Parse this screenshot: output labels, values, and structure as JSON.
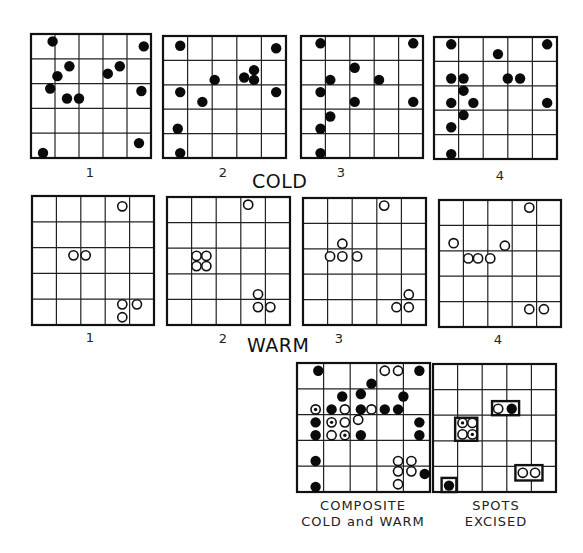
{
  "title_cold": "COLD",
  "title_warm": "WARM",
  "grid_cells": 5,
  "cold": [
    {
      "label": "1",
      "spots": [
        [
          0.9,
          0.3
        ],
        [
          4.7,
          0.5
        ],
        [
          1.6,
          1.3
        ],
        [
          1.1,
          1.7
        ],
        [
          3.2,
          1.6
        ],
        [
          3.7,
          1.3
        ],
        [
          0.8,
          2.2
        ],
        [
          1.5,
          2.6
        ],
        [
          2.0,
          2.6
        ],
        [
          4.6,
          2.3
        ],
        [
          0.5,
          4.8
        ],
        [
          4.5,
          4.4
        ]
      ]
    },
    {
      "label": "2",
      "spots": [
        [
          0.7,
          0.4
        ],
        [
          4.6,
          0.5
        ],
        [
          2.1,
          1.8
        ],
        [
          3.3,
          1.7
        ],
        [
          3.7,
          1.4
        ],
        [
          3.7,
          1.8
        ],
        [
          0.7,
          2.3
        ],
        [
          4.6,
          2.3
        ],
        [
          1.6,
          2.7
        ],
        [
          0.6,
          3.8
        ],
        [
          0.7,
          4.8
        ]
      ]
    },
    {
      "label": "3",
      "spots": [
        [
          0.8,
          0.3
        ],
        [
          4.6,
          0.3
        ],
        [
          2.2,
          1.3
        ],
        [
          1.2,
          1.8
        ],
        [
          3.2,
          1.8
        ],
        [
          0.8,
          2.3
        ],
        [
          2.2,
          2.7
        ],
        [
          4.6,
          2.7
        ],
        [
          1.2,
          3.3
        ],
        [
          0.8,
          3.8
        ],
        [
          0.8,
          4.8
        ]
      ]
    },
    {
      "label": "4",
      "spots": [
        [
          0.7,
          0.3
        ],
        [
          4.6,
          0.3
        ],
        [
          2.6,
          0.7
        ],
        [
          0.7,
          1.7
        ],
        [
          1.2,
          1.7
        ],
        [
          3.0,
          1.7
        ],
        [
          3.5,
          1.7
        ],
        [
          1.2,
          2.2
        ],
        [
          0.7,
          2.7
        ],
        [
          1.6,
          2.7
        ],
        [
          4.6,
          2.7
        ],
        [
          1.2,
          3.2
        ],
        [
          0.7,
          3.7
        ],
        [
          0.7,
          4.8
        ]
      ]
    }
  ],
  "warm": [
    {
      "label": "1",
      "spots": [
        [
          3.7,
          0.4
        ],
        [
          1.7,
          2.3
        ],
        [
          2.2,
          2.3
        ],
        [
          3.7,
          4.2
        ],
        [
          4.3,
          4.2
        ],
        [
          3.7,
          4.7
        ]
      ]
    },
    {
      "label": "2",
      "spots": [
        [
          3.3,
          0.3
        ],
        [
          1.2,
          2.3
        ],
        [
          1.6,
          2.3
        ],
        [
          1.2,
          2.7
        ],
        [
          1.6,
          2.7
        ],
        [
          3.7,
          3.8
        ],
        [
          3.7,
          4.3
        ],
        [
          4.2,
          4.3
        ]
      ]
    },
    {
      "label": "3",
      "spots": [
        [
          3.3,
          0.3
        ],
        [
          1.6,
          1.8
        ],
        [
          1.1,
          2.3
        ],
        [
          1.6,
          2.3
        ],
        [
          2.2,
          2.3
        ],
        [
          4.3,
          3.8
        ],
        [
          3.8,
          4.3
        ],
        [
          4.3,
          4.3
        ]
      ]
    },
    {
      "label": "4",
      "spots": [
        [
          3.7,
          0.3
        ],
        [
          0.6,
          1.7
        ],
        [
          1.2,
          2.3
        ],
        [
          1.6,
          2.3
        ],
        [
          2.1,
          2.3
        ],
        [
          2.7,
          1.8
        ],
        [
          3.7,
          4.3
        ],
        [
          4.3,
          4.3
        ]
      ]
    }
  ],
  "composite": {
    "caption_line1": "COMPOSITE",
    "caption_line2": "COLD and WARM",
    "cold_spots": [
      [
        0.8,
        0.3
      ],
      [
        4.6,
        0.3
      ],
      [
        2.8,
        0.8
      ],
      [
        1.7,
        1.3
      ],
      [
        2.4,
        1.2
      ],
      [
        4.0,
        1.3
      ],
      [
        1.3,
        1.8
      ],
      [
        2.4,
        1.8
      ],
      [
        3.3,
        1.8
      ],
      [
        3.8,
        1.8
      ],
      [
        0.7,
        2.3
      ],
      [
        4.6,
        2.3
      ],
      [
        0.7,
        2.8
      ],
      [
        2.4,
        2.8
      ],
      [
        4.6,
        2.8
      ],
      [
        0.7,
        3.8
      ],
      [
        4.8,
        4.3
      ],
      [
        0.7,
        4.8
      ]
    ],
    "warm_spots": [
      [
        3.3,
        0.3
      ],
      [
        3.8,
        0.3
      ],
      [
        1.8,
        1.8
      ],
      [
        2.8,
        1.8
      ],
      [
        1.8,
        2.3
      ],
      [
        2.3,
        2.2
      ],
      [
        1.3,
        2.8
      ],
      [
        3.8,
        3.8
      ],
      [
        4.3,
        3.8
      ],
      [
        3.8,
        4.2
      ],
      [
        4.3,
        4.2
      ],
      [
        3.8,
        4.7
      ]
    ],
    "mixed_spots": [
      [
        0.7,
        1.8
      ],
      [
        1.3,
        2.3
      ],
      [
        1.8,
        2.8
      ]
    ]
  },
  "excised": {
    "caption_line1": "SPOTS",
    "caption_line2": "EXCISED",
    "groups": [
      {
        "box": [
          0.9,
          2.1,
          1.8,
          3.0
        ],
        "spots": [
          {
            "p": [
              1.2,
              2.3
            ],
            "t": "mixed"
          },
          {
            "p": [
              1.6,
              2.3
            ],
            "t": "warm"
          },
          {
            "p": [
              1.2,
              2.75
            ],
            "t": "warm"
          },
          {
            "p": [
              1.6,
              2.75
            ],
            "t": "mixed"
          }
        ]
      },
      {
        "box": [
          2.4,
          1.45,
          3.5,
          2.0
        ],
        "spots": [
          {
            "p": [
              2.65,
              1.75
            ],
            "t": "warm"
          },
          {
            "p": [
              3.2,
              1.75
            ],
            "t": "cold"
          }
        ]
      },
      {
        "box": [
          3.35,
          3.95,
          4.45,
          4.55
        ],
        "spots": [
          {
            "p": [
              3.65,
              4.25
            ],
            "t": "warm"
          },
          {
            "p": [
              4.15,
              4.25
            ],
            "t": "warm"
          }
        ]
      },
      {
        "box": [
          0.35,
          4.45,
          0.95,
          5.0
        ],
        "spots": [
          {
            "p": [
              0.65,
              4.75
            ],
            "t": "cold"
          }
        ]
      }
    ]
  }
}
